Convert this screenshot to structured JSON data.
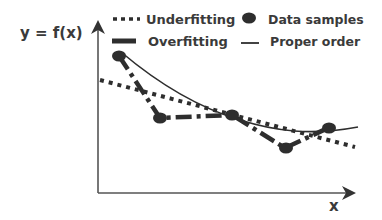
{
  "diagram": {
    "y_axis_label": "y = f(x)",
    "x_axis_label": "x",
    "legend": {
      "underfitting": "Underfitting",
      "overfitting": "Overfitting",
      "data_samples": "Data samples",
      "proper_order": "Proper order"
    },
    "data_points": [
      {
        "x": 119,
        "y": 56
      },
      {
        "x": 160,
        "y": 118
      },
      {
        "x": 232,
        "y": 115
      },
      {
        "x": 285,
        "y": 148
      },
      {
        "x": 328,
        "y": 128
      }
    ],
    "colors": {
      "ink": "#2e2e2e",
      "text": "#3a3a3a",
      "axis": "#555555"
    }
  }
}
